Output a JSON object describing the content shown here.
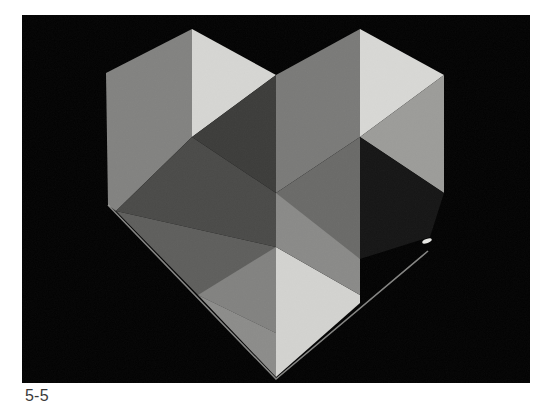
{
  "figure": {
    "caption": "5-5",
    "colors": {
      "background": "#020202",
      "facet_light": "#d9d9d6",
      "facet_mid_light": "#9e9e9b",
      "facet_mid": "#7f7f7c",
      "facet_mid_dark": "#5c5c5a",
      "facet_dark": "#3a3a38",
      "facet_shadow": "#161616"
    }
  }
}
